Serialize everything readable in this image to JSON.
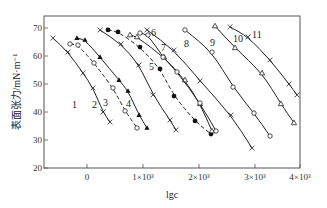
{
  "chart_data": {
    "type": "line",
    "title": "",
    "xlabel": "lgc",
    "ylabel": "表面张力/mN·m⁻¹",
    "xlim": [
      -800,
      4000
    ],
    "ylim": [
      20,
      74
    ],
    "xticks": [
      0,
      1000,
      2000,
      3000,
      4000
    ],
    "xtick_labels": [
      "0",
      "1×10³",
      "2×10³",
      "3×10³",
      "4×10³"
    ],
    "yticks": [
      20,
      30,
      40,
      50,
      60,
      70
    ],
    "ytick_labels": [
      "20",
      "30",
      "40",
      "50",
      "60",
      "70"
    ],
    "grid": false,
    "legend": "inline curve numbers 1–11",
    "series": [
      {
        "name": "1",
        "style": "solid",
        "marker": "x",
        "x": [
          -607,
          -339,
          -71,
          107,
          286,
          411
        ],
        "y": [
          66.4,
          61.4,
          53.9,
          48.6,
          40.0,
          36.4
        ]
      },
      {
        "name": "2",
        "style": "dashed",
        "marker": "o",
        "x": [
          -304,
          -161,
          125,
          464,
          679,
          893
        ],
        "y": [
          64.3,
          63.9,
          57.5,
          48.6,
          40.4,
          34.3
        ]
      },
      {
        "name": "3",
        "style": "solid",
        "marker": "triangle-filled",
        "x": [
          -179,
          -36,
          232,
          571,
          732,
          929,
          1071
        ],
        "y": [
          66.4,
          65.7,
          59.6,
          51.4,
          47.5,
          38.9,
          34.3
        ]
      },
      {
        "name": "4",
        "style": "solid",
        "marker": "x",
        "x": [
          232,
          607,
          929,
          1179,
          1482,
          1589
        ],
        "y": [
          69.3,
          64.3,
          56.8,
          46.1,
          37.1,
          33.6
        ]
      },
      {
        "name": "5",
        "style": "dashed",
        "marker": "dot-filled",
        "x": [
          375,
          554,
          946,
          1304,
          1554,
          1929,
          2214
        ],
        "y": [
          69.3,
          68.6,
          63.2,
          55.4,
          45.7,
          36.8,
          32.1
        ]
      },
      {
        "name": "6",
        "style": "solid",
        "marker": "triangle",
        "x": [
          768,
          893,
          1375,
          1750,
          2018,
          2232
        ],
        "y": [
          67.5,
          66.8,
          59.6,
          51.4,
          42.9,
          33.2
        ]
      },
      {
        "name": "7",
        "style": "solid",
        "marker": "o",
        "x": [
          946,
          1089,
          1357,
          1607,
          2018,
          2304
        ],
        "y": [
          68.2,
          67.5,
          59.6,
          54.3,
          43.2,
          33.2
        ]
      },
      {
        "name": "8",
        "style": "solid",
        "marker": "x",
        "x": [
          1071,
          1554,
          2018,
          2571,
          2946
        ],
        "y": [
          69.3,
          62.1,
          51.1,
          38.9,
          27.1
        ]
      },
      {
        "name": "9",
        "style": "solid",
        "marker": "o",
        "x": [
          1750,
          2232,
          2607,
          2982,
          3268
        ],
        "y": [
          69.3,
          61.4,
          48.9,
          39.6,
          31.4
        ]
      },
      {
        "name": "10",
        "style": "solid",
        "marker": "triangle",
        "x": [
          2286,
          2643,
          3125,
          3464,
          3696
        ],
        "y": [
          70.7,
          62.9,
          53.9,
          42.9,
          36.1
        ]
      },
      {
        "name": "11",
        "style": "solid",
        "marker": "x",
        "x": [
          2554,
          2875,
          3268,
          3607,
          3750
        ],
        "y": [
          70.4,
          66.8,
          58.6,
          50.0,
          46.1
        ]
      }
    ]
  },
  "labels": {
    "y_axis_title": "表面张力/mN·m⁻¹",
    "x_axis_title": "lgc",
    "curve_numbers": [
      "1",
      "2",
      "3",
      "4",
      "5",
      "6",
      "7",
      "8",
      "9",
      "10",
      "11"
    ]
  }
}
